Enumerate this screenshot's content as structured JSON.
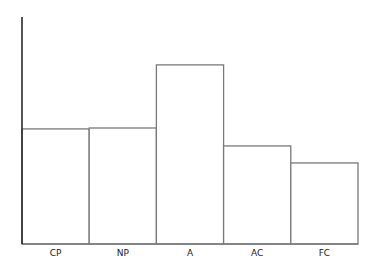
{
  "chart_data": {
    "type": "bar",
    "title": "",
    "xlabel": "",
    "ylabel": "",
    "categories": [
      "CP",
      "NP",
      "A",
      "AC",
      "FC"
    ],
    "values": [
      50.7,
      51.1,
      78.9,
      43.2,
      35.7
    ],
    "ylim": [
      0,
      100
    ],
    "y_ticks_shown": false,
    "grid": false,
    "legend": "none",
    "bar_gap": 0,
    "colors": {
      "bar_fill": "#ffffff",
      "bar_stroke": "#7a7a7a",
      "axis": "#2a2a2a",
      "text": "#222222"
    }
  }
}
